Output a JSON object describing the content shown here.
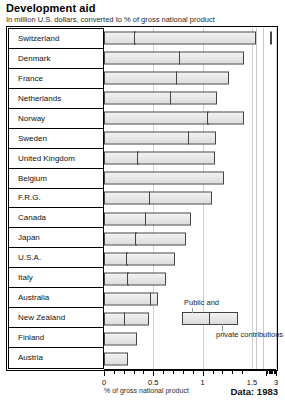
{
  "header": {
    "title": "Development aid",
    "subtitle": "In million U.S. dollars, converted to % of gross national product"
  },
  "footer": {
    "axis_title": "% of gross national product",
    "source": "Data: 1983"
  },
  "legend": {
    "public_label": "Public and",
    "private_label": "private contributions"
  },
  "chart_data": {
    "type": "bar",
    "orientation": "horizontal",
    "stacked": true,
    "title": "Development aid",
    "subtitle": "In million U.S. dollars, converted to % of gross national product",
    "xlabel": "% of gross national product",
    "ylabel": "",
    "grid": true,
    "legend_position": "inside-center",
    "axis_break": true,
    "axis_break_note": "Axis is broken between 1.5 and 3; Switzerland's total extends past the break.",
    "xlim": [
      0,
      3.2
    ],
    "tick_labels": [
      "0",
      "0.5",
      "1",
      "1.5",
      "3"
    ],
    "tick_values": [
      0,
      0.5,
      1,
      1.5,
      3
    ],
    "minor_tick_step": 0.1,
    "categories": [
      "Switzerland",
      "Denmark",
      "France",
      "Netherlands",
      "Norway",
      "Sweden",
      "United Kingdom",
      "Belgium",
      "F.R.G.",
      "Canada",
      "Japan",
      "U.S.A.",
      "Italy",
      "Australia",
      "New Zealand",
      "Finland",
      "Austria"
    ],
    "series": [
      {
        "name": "Public and",
        "key": "public",
        "values": [
          0.32,
          0.77,
          0.74,
          0.68,
          1.06,
          0.86,
          0.35,
          1.22,
          0.47,
          0.43,
          0.33,
          0.24,
          0.25,
          0.48,
          0.21,
          0.33,
          0.24
        ]
      },
      {
        "name": "private contributions",
        "key": "private",
        "values": [
          1.52,
          0.65,
          0.53,
          0.47,
          0.36,
          0.28,
          0.77,
          0.0,
          0.62,
          0.45,
          0.5,
          0.48,
          0.38,
          0.07,
          0.25,
          0.0,
          0.0
        ]
      }
    ],
    "totals": [
      3.05,
      1.42,
      1.27,
      1.15,
      1.42,
      1.14,
      1.12,
      1.22,
      1.09,
      0.88,
      0.83,
      0.72,
      0.63,
      0.55,
      0.46,
      0.33,
      0.24
    ]
  }
}
